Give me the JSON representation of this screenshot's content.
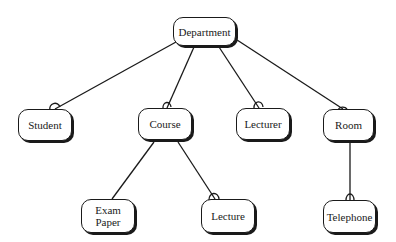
{
  "diagram": {
    "type": "hierarchy",
    "root": "Department",
    "nodes": {
      "department": {
        "label": "Department"
      },
      "student": {
        "label": "Student"
      },
      "course": {
        "label": "Course"
      },
      "lecturer": {
        "label": "Lecturer"
      },
      "room": {
        "label": "Room"
      },
      "exam_paper": {
        "line1": "Exam",
        "line2": "Paper"
      },
      "lecture": {
        "label": "Lecture"
      },
      "telephone": {
        "label": "Telephone"
      }
    },
    "edges": [
      {
        "from": "Department",
        "to": "Student",
        "end_marker": "arc"
      },
      {
        "from": "Department",
        "to": "Course",
        "end_marker": "arc"
      },
      {
        "from": "Department",
        "to": "Lecturer",
        "end_marker": "arc"
      },
      {
        "from": "Department",
        "to": "Room",
        "end_marker": "arc"
      },
      {
        "from": "Course",
        "to": "Exam Paper",
        "end_marker": "none"
      },
      {
        "from": "Course",
        "to": "Lecture",
        "end_marker": "arc"
      },
      {
        "from": "Room",
        "to": "Telephone",
        "end_marker": "arc"
      }
    ],
    "colors": {
      "stroke": "#1a1a1a",
      "fill": "#ffffff"
    }
  }
}
